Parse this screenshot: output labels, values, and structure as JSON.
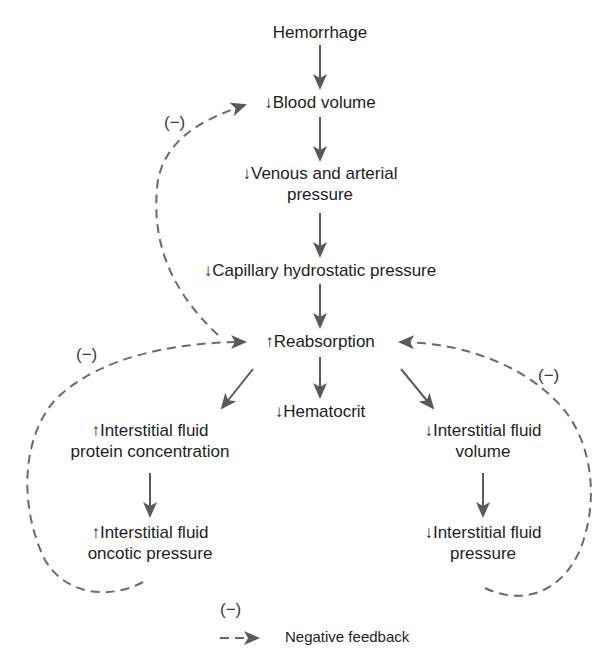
{
  "nodes": {
    "hemorrhage": "Hemorrhage",
    "blood_volume": "↓Blood volume",
    "venous_pressure_l1": "↓Venous and arterial",
    "venous_pressure_l2": "pressure",
    "capillary_pressure": "↓Capillary hydrostatic pressure",
    "reabsorption": "↑Reabsorption",
    "hematocrit": "↓Hematocrit",
    "if_protein_l1": "↑Interstitial fluid",
    "if_protein_l2": "protein concentration",
    "if_oncotic_l1": "↑Interstitial fluid",
    "if_oncotic_l2": "oncotic pressure",
    "if_volume_l1": "↓Interstitial fluid",
    "if_volume_l2": "volume",
    "if_pressure_l1": "↓Interstitial fluid",
    "if_pressure_l2": "pressure"
  },
  "feedback_signs": {
    "top_left": "(−)",
    "left": "(−)",
    "right": "(−)"
  },
  "legend": {
    "sign": "(−)",
    "label": "Negative feedback"
  },
  "colors": {
    "arrow": "#5a5a5a",
    "dashed": "#6a6a6a"
  }
}
